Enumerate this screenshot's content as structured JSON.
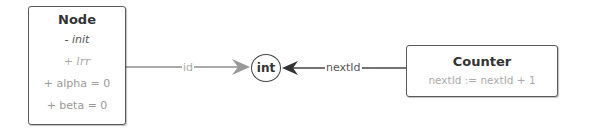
{
  "diagram": {
    "nodes": [
      {
        "id": "node",
        "title": "Node",
        "lines": [
          "- init",
          "+ lrr",
          "+ alpha = 0",
          "+ beta = 0"
        ]
      },
      {
        "id": "int",
        "title": "int",
        "shape": "circle"
      },
      {
        "id": "counter",
        "title": "Counter",
        "lines": [
          "nextId := nextId + 1"
        ]
      }
    ],
    "edges": [
      {
        "from": "node",
        "to": "int",
        "label": "id",
        "color": "#aaaaaa"
      },
      {
        "from": "counter",
        "to": "int",
        "label": "nextId",
        "color": "#444444"
      }
    ]
  },
  "colors": {
    "box_border": "#5a5a5a",
    "title_text": "#333333",
    "muted_text": "#aaaaaa",
    "edge_id": "#aaaaaa",
    "edge_nextid": "#444444"
  }
}
